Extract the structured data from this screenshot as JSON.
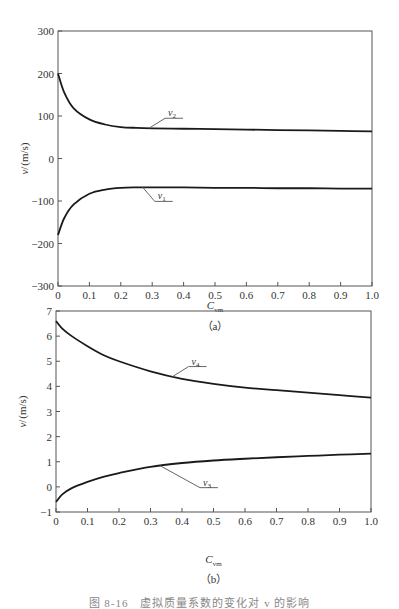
{
  "caption": "图 8-16　虚拟质量系数的变化对 v 的影响",
  "chart_data": [
    {
      "type": "line",
      "panel": "(a)",
      "title": "",
      "xlabel": "C_vm",
      "ylabel": "v/(m/s)",
      "xlim": [
        0,
        1.0
      ],
      "ylim": [
        -300,
        300
      ],
      "x_ticks": [
        "0",
        "0.1",
        "0.2",
        "0.3",
        "0.4",
        "0.5",
        "0.6",
        "0.7",
        "0.8",
        "0.9",
        "1.0"
      ],
      "y_ticks": [
        "300",
        "200",
        "100",
        "0",
        "-100",
        "-200",
        "-300"
      ],
      "grid": false,
      "legend": "inline callouts",
      "x": [
        0,
        0.02,
        0.05,
        0.1,
        0.15,
        0.2,
        0.25,
        0.3,
        0.4,
        0.5,
        0.6,
        0.7,
        0.8,
        0.9,
        1.0
      ],
      "series": [
        {
          "name": "v2",
          "label_main": "v",
          "label_sub": "2",
          "values": [
            200,
            155,
            118,
            92,
            80,
            74,
            72,
            71,
            70,
            69,
            68,
            67,
            66,
            65,
            64
          ]
        },
        {
          "name": "v1",
          "label_main": "v",
          "label_sub": "1",
          "values": [
            -180,
            -140,
            -108,
            -83,
            -73,
            -69,
            -68,
            -68,
            -68,
            -69,
            -69,
            -70,
            -70,
            -71,
            -71
          ]
        }
      ]
    },
    {
      "type": "line",
      "panel": "(b)",
      "title": "",
      "xlabel": "C_vm",
      "ylabel": "v/(m/s)",
      "xlim": [
        0,
        1.0
      ],
      "ylim": [
        -1,
        7
      ],
      "x_ticks": [
        "0",
        "0.1",
        "0.2",
        "0.3",
        "0.4",
        "0.5",
        "0.6",
        "0.7",
        "0.8",
        "0.9",
        "1.0"
      ],
      "y_ticks": [
        "7",
        "6",
        "5",
        "4",
        "3",
        "2",
        "1",
        "0",
        "-1"
      ],
      "grid": false,
      "legend": "inline callouts",
      "x": [
        0,
        0.02,
        0.05,
        0.1,
        0.15,
        0.2,
        0.3,
        0.4,
        0.5,
        0.6,
        0.7,
        0.8,
        0.9,
        1.0
      ],
      "series": [
        {
          "name": "v4",
          "label_main": "v",
          "label_sub": "4",
          "values": [
            6.6,
            6.3,
            6.0,
            5.6,
            5.25,
            5.0,
            4.6,
            4.3,
            4.1,
            3.95,
            3.85,
            3.75,
            3.65,
            3.55
          ]
        },
        {
          "name": "v3",
          "label_main": "v",
          "label_sub": "3",
          "values": [
            -0.6,
            -0.3,
            -0.05,
            0.2,
            0.4,
            0.55,
            0.8,
            0.95,
            1.05,
            1.12,
            1.18,
            1.23,
            1.28,
            1.32
          ]
        }
      ]
    }
  ]
}
